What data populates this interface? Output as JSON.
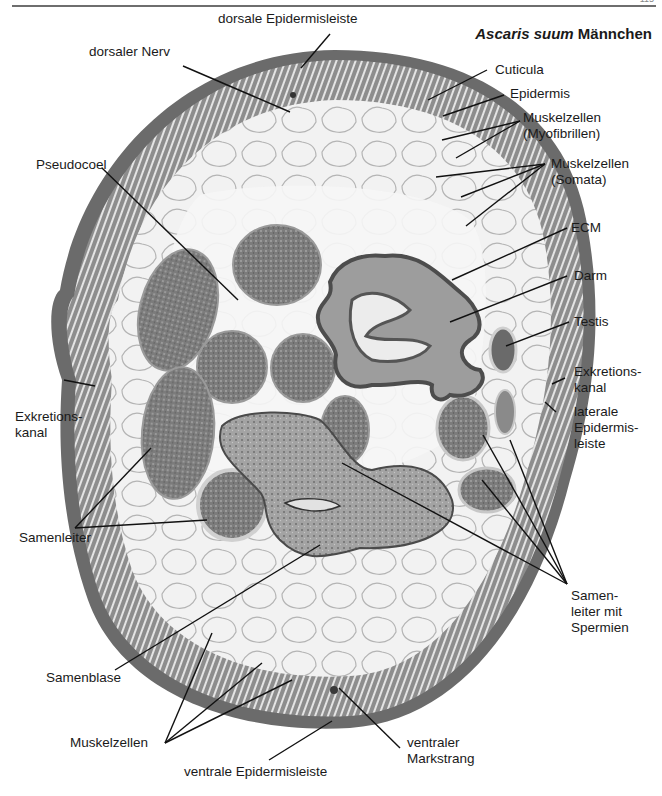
{
  "page": {
    "number": "115"
  },
  "figure": {
    "title_italic": "Ascaris suum",
    "title_rest": " Männchen"
  },
  "labels": {
    "dorsale_epidermisleiste": "dorsale Epidermisleiste",
    "dorsaler_nerv": "dorsaler Nerv",
    "cuticula": "Cuticula",
    "epidermis": "Epidermis",
    "muskel_myo_1": "Muskelzellen",
    "muskel_myo_2": "(Myofibrillen)",
    "pseudocoel": "Pseudocoel",
    "muskel_somata_1": "Muskelzellen",
    "muskel_somata_2": "(Somata)",
    "ecm": "ECM",
    "darm": "Darm",
    "testis": "Testis",
    "exkretion_r_1": "Exkretions-",
    "exkretion_r_2": "kanal",
    "laterale_1": "laterale",
    "laterale_2": "Epidermis-",
    "laterale_3": "leiste",
    "exkretion_l_1": "Exkretions-",
    "exkretion_l_2": "kanal",
    "samenleiter": "Samenleiter",
    "samenleiter_sp_1": "Samen-",
    "samenleiter_sp_2": "leiter mit",
    "samenleiter_sp_3": "Spermien",
    "samenblase": "Samenblase",
    "muskelzellen": "Muskelzellen",
    "ventraler_1": "ventraler",
    "ventraler_2": "Markstrang",
    "ventrale_epidermisleiste": "ventrale Epidermisleiste"
  },
  "colors": {
    "cuticle": "#6b6b6b",
    "muscle_layer": "#8d8d8d",
    "interior": "#f4f4f4",
    "sperm_mass": "#7e7e7e",
    "gut_wall": "#5e5e5e",
    "leader_line": "#111111"
  }
}
